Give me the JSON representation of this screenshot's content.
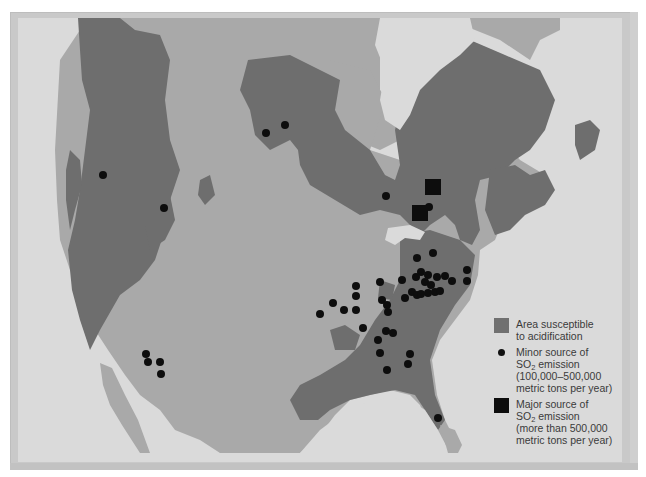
{
  "map": {
    "title": "Areas susceptible to acidification and SO2 emission sources in North America",
    "colors": {
      "water": "#dadada",
      "land": "#a9a9a9",
      "susceptible": "#6e6e6e",
      "source": "#0d0d0d",
      "frame": "#c9c9c9"
    },
    "minor_sources": [
      [
        103,
        175
      ],
      [
        164,
        208
      ],
      [
        266,
        133
      ],
      [
        285,
        125
      ],
      [
        386,
        196
      ],
      [
        429,
        207
      ],
      [
        417,
        258
      ],
      [
        433,
        253
      ],
      [
        421,
        272
      ],
      [
        380,
        282
      ],
      [
        356,
        286
      ],
      [
        356,
        296
      ],
      [
        333,
        303
      ],
      [
        344,
        310
      ],
      [
        320,
        314
      ],
      [
        356,
        310
      ],
      [
        382,
        300
      ],
      [
        387,
        305
      ],
      [
        405,
        298
      ],
      [
        402,
        280
      ],
      [
        412,
        292
      ],
      [
        416,
        277
      ],
      [
        428,
        275
      ],
      [
        425,
        282
      ],
      [
        437,
        277
      ],
      [
        445,
        276
      ],
      [
        452,
        281
      ],
      [
        467,
        270
      ],
      [
        467,
        281
      ],
      [
        417,
        295
      ],
      [
        428,
        293
      ],
      [
        435,
        292
      ],
      [
        440,
        291
      ],
      [
        421,
        294
      ],
      [
        431,
        285
      ],
      [
        388,
        312
      ],
      [
        363,
        328
      ],
      [
        386,
        331
      ],
      [
        393,
        333
      ],
      [
        378,
        340
      ],
      [
        380,
        353
      ],
      [
        410,
        354
      ],
      [
        408,
        364
      ],
      [
        387,
        370
      ],
      [
        146,
        354
      ],
      [
        148,
        362
      ],
      [
        160,
        362
      ],
      [
        161,
        374
      ],
      [
        438,
        418
      ]
    ],
    "major_sources": [
      [
        433,
        187
      ],
      [
        420,
        213
      ]
    ]
  },
  "legend": {
    "items": [
      {
        "key": "area",
        "lines": [
          "Area susceptible",
          "to acidification"
        ]
      },
      {
        "key": "minor",
        "line1": "Minor source of",
        "so_line_pre": "SO",
        "so_sub": "2",
        "so_line_post": " emission",
        "line3": "(100,000–500,000",
        "line4": "metric tons per year)"
      },
      {
        "key": "major",
        "line1": "Major source of",
        "so_line_pre": "SO",
        "so_sub": "2",
        "so_line_post": " emission",
        "line3": "(more than 500,000",
        "line4": "metric tons per year)"
      }
    ]
  }
}
